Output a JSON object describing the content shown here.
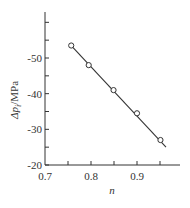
{
  "chart_data": {
    "type": "scatter",
    "title": "",
    "xlabel": "n",
    "ylabel": "Δp_i/MPa",
    "ylabel_main": "Δp",
    "ylabel_sub": "i",
    "ylabel_unit": "/MPa",
    "xlim": [
      0.7,
      0.98
    ],
    "ylim": [
      -20,
      -63
    ],
    "x_ticks": [
      0.7,
      0.8,
      0.9
    ],
    "x_tick_labels": [
      "0.7",
      "0.8",
      "0.9"
    ],
    "x_minor_ticks": [
      0.75,
      0.85,
      0.95
    ],
    "y_ticks": [
      -20,
      -30,
      -40,
      -50
    ],
    "y_tick_labels": [
      "-20",
      "-30",
      "-40",
      "-50"
    ],
    "y_minor_ticks": [
      -25,
      -35,
      -45,
      -55,
      -60
    ],
    "grid": false,
    "series": [
      {
        "name": "measured",
        "marker": "circle-open",
        "x": [
          0.757,
          0.795,
          0.849,
          0.9,
          0.951
        ],
        "y": [
          -53.5,
          -48.0,
          -41.0,
          -34.5,
          -27.0
        ]
      },
      {
        "name": "fit",
        "style": "line",
        "x": [
          0.757,
          0.963
        ],
        "y": [
          -53.5,
          -25.0
        ]
      }
    ],
    "colors": {
      "ink": "#333333"
    }
  }
}
